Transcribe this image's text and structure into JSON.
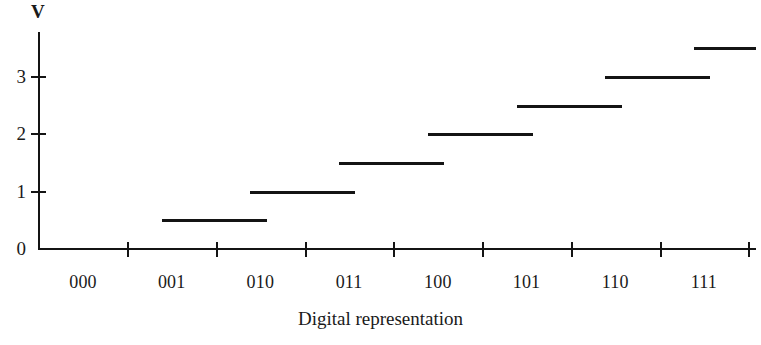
{
  "chart_data": {
    "type": "line",
    "title": "",
    "subtitle": "",
    "xlabel": "Digital representation",
    "ylabel": "V",
    "categories": [
      "000",
      "001",
      "010",
      "011",
      "100",
      "101",
      "110",
      "111"
    ],
    "values": [
      0,
      0.5,
      1.0,
      1.5,
      2.0,
      2.5,
      3.0,
      3.5
    ],
    "series": [
      {
        "name": "Analog output",
        "values": [
          0,
          0.5,
          1.0,
          1.5,
          2.0,
          2.5,
          3.0,
          3.5
        ]
      }
    ],
    "y_tick_labels": [
      "0",
      "1",
      "2",
      "3"
    ],
    "y_tick_values": [
      0,
      1,
      2,
      3
    ],
    "ylim": [
      0,
      3.8
    ],
    "xlim": [
      -0.5,
      7.5
    ],
    "grid": false,
    "legend": "none",
    "step_style": "staircase",
    "annotations": []
  },
  "axes": {
    "y_axis_label": "V",
    "x_axis_title": "Digital representation"
  },
  "colors": {
    "line": "#141414",
    "axis": "#141414",
    "background": "#ffffff",
    "text": "#1a1a1a"
  }
}
